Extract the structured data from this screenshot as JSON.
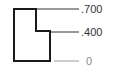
{
  "diagram": {
    "type": "ordinate-dimension",
    "labels": [
      ".700",
      ".400",
      "0"
    ],
    "colors": {
      "outline": "#1a1a1a",
      "extension": "#333333",
      "zero_line": "#9a9a9a"
    }
  }
}
